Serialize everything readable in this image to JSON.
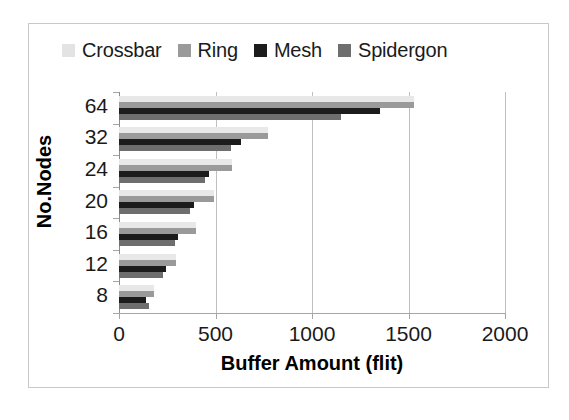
{
  "chart_data": {
    "type": "bar",
    "orientation": "horizontal",
    "title": "",
    "xlabel": "Buffer Amount (flit)",
    "ylabel": "No.Nodes",
    "categories": [
      "64",
      "32",
      "24",
      "20",
      "16",
      "12",
      "8"
    ],
    "xlim": [
      0,
      2000
    ],
    "xticks": [
      "0",
      "500",
      "1000",
      "1500",
      "2000"
    ],
    "grid": "vertical",
    "legend_position": "top",
    "series": [
      {
        "name": "Crossbar",
        "color": "#e8e8e8",
        "values": [
          1530,
          770,
          585,
          490,
          400,
          295,
          180
        ]
      },
      {
        "name": "Ring",
        "color": "#9a9a9a",
        "values": [
          1530,
          770,
          585,
          490,
          400,
          295,
          180
        ]
      },
      {
        "name": "Mesh",
        "color": "#1c1c1c",
        "values": [
          1350,
          630,
          465,
          390,
          305,
          245,
          140
        ]
      },
      {
        "name": "Spidergon",
        "color": "#6e6e6e",
        "values": [
          1150,
          580,
          445,
          370,
          290,
          230,
          155
        ]
      }
    ]
  },
  "legend": {
    "items": [
      {
        "label": "Crossbar",
        "color": "#e3e3e3"
      },
      {
        "label": "Ring",
        "color": "#9a9a9a"
      },
      {
        "label": "Mesh",
        "color": "#1c1c1c"
      },
      {
        "label": "Spidergon",
        "color": "#6e6e6e"
      }
    ]
  },
  "axes": {
    "x": {
      "title": "Buffer Amount (flit)",
      "ticks": [
        "0",
        "500",
        "1000",
        "1500",
        "2000"
      ]
    },
    "y": {
      "title": "No.Nodes",
      "ticks": [
        "64",
        "32",
        "24",
        "20",
        "16",
        "12",
        "8"
      ]
    }
  }
}
